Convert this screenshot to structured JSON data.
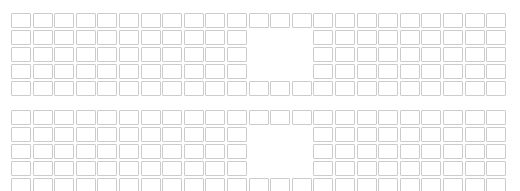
{
  "canvas": {
    "width": 520,
    "height": 191,
    "background": "#ffffff"
  },
  "style": {
    "cell_border_color": "#cccccc",
    "cell_fill_color": "#ffffff",
    "cell_width": 20,
    "cell_height": 15,
    "cell_step_x": 21.6,
    "cell_step_y": 17,
    "cell_border_radius": 1
  },
  "layout": {
    "columns": 23,
    "rows": 5,
    "origin_x": 11,
    "gap_columns": [
      11,
      12,
      13
    ],
    "gap_rows": [
      1,
      2,
      3
    ],
    "description": "Two identical grids of empty outlined cells, each with a rectangular notch removed from the middle"
  },
  "grids": [
    {
      "name": "top-grid",
      "origin_y": 13,
      "rows": [
        {
          "index": 0,
          "cells": [
            1,
            1,
            1,
            1,
            1,
            1,
            1,
            1,
            1,
            1,
            1,
            1,
            1,
            1,
            1,
            1,
            1,
            1,
            1,
            1,
            1,
            1,
            1
          ]
        },
        {
          "index": 1,
          "cells": [
            1,
            1,
            1,
            1,
            1,
            1,
            1,
            1,
            1,
            1,
            1,
            0,
            0,
            0,
            1,
            1,
            1,
            1,
            1,
            1,
            1,
            1,
            1
          ]
        },
        {
          "index": 2,
          "cells": [
            1,
            1,
            1,
            1,
            1,
            1,
            1,
            1,
            1,
            1,
            1,
            0,
            0,
            0,
            1,
            1,
            1,
            1,
            1,
            1,
            1,
            1,
            1
          ]
        },
        {
          "index": 3,
          "cells": [
            1,
            1,
            1,
            1,
            1,
            1,
            1,
            1,
            1,
            1,
            1,
            0,
            0,
            0,
            1,
            1,
            1,
            1,
            1,
            1,
            1,
            1,
            1
          ]
        },
        {
          "index": 4,
          "cells": [
            1,
            1,
            1,
            1,
            1,
            1,
            1,
            1,
            1,
            1,
            1,
            1,
            1,
            1,
            1,
            1,
            1,
            1,
            1,
            1,
            1,
            1,
            1
          ]
        }
      ]
    },
    {
      "name": "bottom-grid",
      "origin_y": 110,
      "rows": [
        {
          "index": 0,
          "cells": [
            1,
            1,
            1,
            1,
            1,
            1,
            1,
            1,
            1,
            1,
            1,
            1,
            1,
            1,
            1,
            1,
            1,
            1,
            1,
            1,
            1,
            1,
            1
          ]
        },
        {
          "index": 1,
          "cells": [
            1,
            1,
            1,
            1,
            1,
            1,
            1,
            1,
            1,
            1,
            1,
            0,
            0,
            0,
            1,
            1,
            1,
            1,
            1,
            1,
            1,
            1,
            1
          ]
        },
        {
          "index": 2,
          "cells": [
            1,
            1,
            1,
            1,
            1,
            1,
            1,
            1,
            1,
            1,
            1,
            0,
            0,
            0,
            1,
            1,
            1,
            1,
            1,
            1,
            1,
            1,
            1
          ]
        },
        {
          "index": 3,
          "cells": [
            1,
            1,
            1,
            1,
            1,
            1,
            1,
            1,
            1,
            1,
            1,
            0,
            0,
            0,
            1,
            1,
            1,
            1,
            1,
            1,
            1,
            1,
            1
          ]
        },
        {
          "index": 4,
          "cells": [
            1,
            1,
            1,
            1,
            1,
            1,
            1,
            1,
            1,
            1,
            1,
            1,
            1,
            1,
            1,
            1,
            1,
            1,
            1,
            1,
            1,
            1,
            1
          ]
        }
      ]
    }
  ]
}
